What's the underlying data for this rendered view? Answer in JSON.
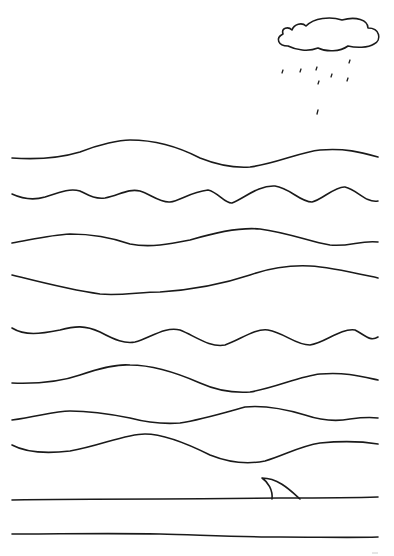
{
  "worksheet": {
    "background": "#ffffff",
    "ink_color": "#1a1a1a",
    "elements": {
      "cloud": "rain-cloud-icon",
      "raindrops": "raindrop-icon",
      "wave_lines": 10,
      "fin": "shark-fin-icon"
    }
  }
}
